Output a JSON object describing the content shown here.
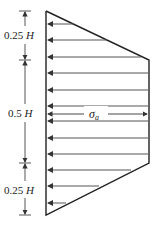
{
  "diagram": {
    "dimensions": [
      {
        "label": "0.25 H",
        "from_y": 11,
        "to_y": 60
      },
      {
        "label": "0.5 H",
        "from_y": 60,
        "to_y": 163
      },
      {
        "label": "0.25 H",
        "from_y": 163,
        "to_y": 215
      }
    ],
    "pressure_label": "σ",
    "pressure_subscript": "a",
    "colors": {
      "line": "#222222",
      "arrow": "#444444",
      "background": "#ffffff"
    }
  }
}
